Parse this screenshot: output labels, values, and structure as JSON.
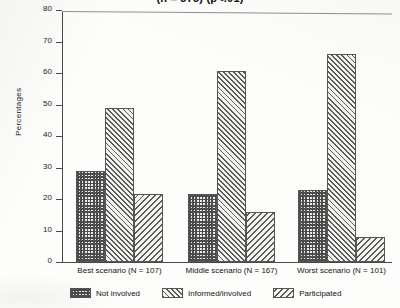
{
  "chart_data": {
    "type": "bar",
    "title": "(n = 375) (p<.01)",
    "xlabel": "",
    "ylabel": "Percentages",
    "ylim": [
      0,
      80
    ],
    "yticks": [
      0,
      10,
      20,
      30,
      40,
      50,
      60,
      70,
      80
    ],
    "grid": false,
    "legend_position": "bottom",
    "categories": [
      "Best scenario (N = 107)",
      "Middle scenario (N = 167)",
      "Worst scenario (N = 101)"
    ],
    "series": [
      {
        "name": "Not involved",
        "values": [
          29,
          21.5,
          23
        ]
      },
      {
        "name": "Informed/involved",
        "values": [
          49,
          60.5,
          66
        ]
      },
      {
        "name": "Participated",
        "values": [
          21.5,
          16,
          8
        ]
      }
    ]
  },
  "axis": {
    "y_tick_0": "0",
    "y_tick_10": "10",
    "y_tick_20": "20",
    "y_tick_30": "30",
    "y_tick_40": "40",
    "y_tick_50": "50",
    "y_tick_60": "60",
    "y_tick_70": "70",
    "y_tick_80": "80"
  },
  "colors": {
    "axis": "#4a4a4a",
    "bar_outline": "#555555",
    "hatch": "#5a5a5a",
    "text": "#141414",
    "paper": "#fdfdfc"
  }
}
